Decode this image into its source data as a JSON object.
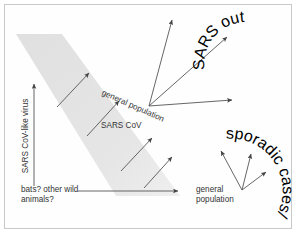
{
  "figure": {
    "background_color": "#ffffff",
    "border_color": "#c9c9c9",
    "arrow_color": "#555555",
    "band_color": "#e3e3e3",
    "text_color": "#333333"
  },
  "labels": {
    "reservoir_axis": "SARS CoV-like virus",
    "animal_source": "bats? other wild animals?",
    "intermediate_virus": "SARS CoV",
    "general_population_mid": "general population",
    "general_population_bottom": "general population",
    "sars_outbreak": "SARS outbreak",
    "sporadic_cases": "sporadic cases/small outbreaks"
  },
  "arrows": [
    {
      "name": "reservoir-vertical-arrow",
      "from": [
        34,
        186
      ],
      "to": [
        34,
        84
      ]
    },
    {
      "name": "animal-to-general-population-arrow",
      "from": [
        78,
        191
      ],
      "to": [
        178,
        191
      ]
    },
    {
      "name": "band-arrow-upper-left",
      "from": [
        57,
        107
      ],
      "to": [
        89,
        73
      ]
    },
    {
      "name": "band-arrow-lower-left",
      "from": [
        87,
        136
      ],
      "to": [
        119,
        101
      ]
    },
    {
      "name": "band-arrow-upper-mid",
      "from": [
        121,
        171
      ],
      "to": [
        152,
        138
      ]
    },
    {
      "name": "band-arrow-lower-mid",
      "from": [
        144,
        188
      ],
      "to": [
        172,
        157
      ]
    },
    {
      "name": "outbreak-fan-arrow-up",
      "from": [
        149,
        106
      ],
      "to": [
        172,
        20
      ]
    },
    {
      "name": "outbreak-fan-arrow-diagonal",
      "from": [
        149,
        106
      ],
      "to": [
        227,
        37
      ]
    },
    {
      "name": "outbreak-fan-arrow-right",
      "from": [
        149,
        106
      ],
      "to": [
        232,
        100
      ]
    },
    {
      "name": "sporadic-fan-arrow-left",
      "from": [
        242,
        190
      ],
      "to": [
        221,
        151
      ]
    },
    {
      "name": "sporadic-fan-arrow-up",
      "from": [
        242,
        190
      ],
      "to": [
        251,
        154
      ]
    },
    {
      "name": "sporadic-fan-arrow-right",
      "from": [
        242,
        190
      ],
      "to": [
        266,
        172
      ]
    }
  ],
  "band": {
    "name": "transition-band",
    "description": "diagonal shaded band from upper-left to lower-right",
    "points": "16,34 62,34 180,196 116,196"
  }
}
